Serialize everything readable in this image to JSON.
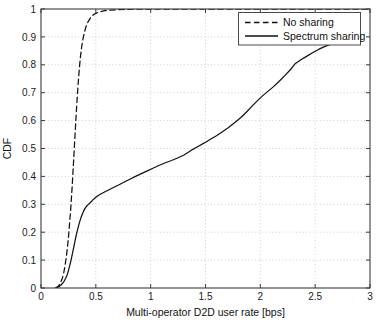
{
  "chart_data": {
    "type": "line",
    "title": "",
    "xlabel": "Multi-operator D2D user rate [bps]",
    "ylabel": "CDF",
    "xlim": [
      0,
      3
    ],
    "ylim": [
      0,
      1
    ],
    "grid": true,
    "legend_position": "top-right",
    "xticks": [
      "0",
      "0.5",
      "1",
      "1.5",
      "2",
      "2.5",
      "3"
    ],
    "xtick_values": [
      0,
      0.5,
      1,
      1.5,
      2,
      2.5,
      3
    ],
    "yticks": [
      "0",
      "0.1",
      "0.2",
      "0.3",
      "0.4",
      "0.5",
      "0.6",
      "0.7",
      "0.8",
      "0.9",
      "1"
    ],
    "ytick_values": [
      0,
      0.1,
      0.2,
      0.3,
      0.4,
      0.5,
      0.6,
      0.7,
      0.8,
      0.9,
      1.0
    ],
    "series": [
      {
        "name": "No sharing",
        "style": "dashed",
        "color": "#111111",
        "x": [
          0.13,
          0.15,
          0.165,
          0.18,
          0.195,
          0.208,
          0.22,
          0.232,
          0.243,
          0.252,
          0.26,
          0.268,
          0.275,
          0.282,
          0.288,
          0.294,
          0.3,
          0.306,
          0.312,
          0.318,
          0.324,
          0.33,
          0.337,
          0.344,
          0.352,
          0.36,
          0.37,
          0.382,
          0.396,
          0.412,
          0.43,
          0.452,
          0.48,
          0.52,
          0.58,
          0.7,
          0.9,
          1.2,
          1.6,
          2.0,
          2.4,
          2.7,
          3.0
        ],
        "y": [
          0.0,
          0.004,
          0.01,
          0.02,
          0.036,
          0.056,
          0.082,
          0.115,
          0.152,
          0.19,
          0.228,
          0.268,
          0.308,
          0.35,
          0.39,
          0.432,
          0.475,
          0.518,
          0.56,
          0.602,
          0.643,
          0.682,
          0.722,
          0.76,
          0.797,
          0.83,
          0.862,
          0.891,
          0.917,
          0.938,
          0.955,
          0.969,
          0.98,
          0.988,
          0.994,
          0.998,
          1.0,
          1.0,
          1.0,
          1.0,
          1.0,
          1.0,
          1.0
        ]
      },
      {
        "name": "Spectrum sharing",
        "style": "solid",
        "color": "#111111",
        "x": [
          0.14,
          0.16,
          0.178,
          0.195,
          0.21,
          0.224,
          0.238,
          0.25,
          0.262,
          0.274,
          0.286,
          0.298,
          0.31,
          0.322,
          0.334,
          0.346,
          0.358,
          0.37,
          0.382,
          0.394,
          0.406,
          0.418,
          0.43,
          0.442,
          0.455,
          0.47,
          0.49,
          0.515,
          0.545,
          0.58,
          0.62,
          0.665,
          0.712,
          0.76,
          0.81,
          0.862,
          0.915,
          0.97,
          1.025,
          1.08,
          1.135,
          1.19,
          1.245,
          1.3,
          1.34,
          1.385,
          1.435,
          1.49,
          1.545,
          1.6,
          1.655,
          1.71,
          1.765,
          1.82,
          1.872,
          1.92,
          1.965,
          2.01,
          2.06,
          2.115,
          2.17,
          2.225,
          2.28,
          2.32,
          2.37,
          2.425,
          2.48,
          2.535,
          2.59,
          2.645,
          2.7
        ],
        "y": [
          0.0,
          0.004,
          0.009,
          0.016,
          0.024,
          0.034,
          0.047,
          0.062,
          0.08,
          0.1,
          0.122,
          0.145,
          0.168,
          0.19,
          0.21,
          0.228,
          0.244,
          0.258,
          0.27,
          0.28,
          0.288,
          0.294,
          0.299,
          0.303,
          0.308,
          0.315,
          0.322,
          0.33,
          0.337,
          0.344,
          0.352,
          0.361,
          0.37,
          0.38,
          0.39,
          0.4,
          0.41,
          0.42,
          0.43,
          0.44,
          0.449,
          0.457,
          0.466,
          0.476,
          0.486,
          0.497,
          0.508,
          0.52,
          0.533,
          0.546,
          0.56,
          0.575,
          0.592,
          0.61,
          0.63,
          0.65,
          0.668,
          0.685,
          0.702,
          0.72,
          0.74,
          0.762,
          0.785,
          0.805,
          0.818,
          0.831,
          0.844,
          0.856,
          0.866,
          0.874,
          0.88
        ]
      }
    ]
  },
  "legend": {
    "entries": [
      {
        "label": "No sharing",
        "style": "dashed"
      },
      {
        "label": "Spectrum sharing",
        "style": "solid"
      }
    ]
  }
}
